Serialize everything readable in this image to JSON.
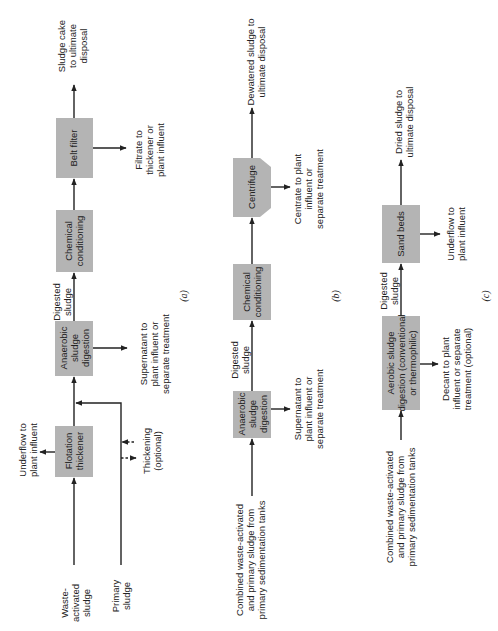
{
  "diagrams": {
    "a": {
      "label": "(a)",
      "boxes": {
        "flotation": [
          "Flotation",
          "thickener"
        ],
        "anaerobic": [
          "Anaerobic",
          "sludge",
          "digestion"
        ],
        "chemical": [
          "Chemical",
          "conditioning"
        ],
        "belt": [
          "Belt filter"
        ]
      },
      "texts": {
        "waste": [
          "Waste-",
          "activated",
          "sludge"
        ],
        "primary": [
          "Primary",
          "sludge"
        ],
        "underflow": [
          "Underflow to",
          "plant influent"
        ],
        "thickening": [
          "Thickening",
          "(optional)"
        ],
        "supernatant": [
          "Supernatant to",
          "plant influent or",
          "separate treatment"
        ],
        "digested": [
          "Digested",
          "sludge"
        ],
        "filtrate": [
          "Filtrate to",
          "thickener or",
          "plant influent"
        ],
        "cake": [
          "Sludge cake",
          "to ultimate",
          "disposal"
        ]
      }
    },
    "b": {
      "label": "(b)",
      "boxes": {
        "anaerobic": [
          "Anaerobic",
          "sludge",
          "digestion"
        ],
        "chemical": [
          "Chemical",
          "conditioning"
        ],
        "centrifuge": [
          "Centrifuge"
        ]
      },
      "texts": {
        "combined": [
          "Combined waste-activated",
          "and primary sludge from",
          "primary sedimentation tanks"
        ],
        "supernatant": [
          "Supernatant to",
          "plant influent or",
          "separate treatment"
        ],
        "digested": [
          "Digested",
          "sludge"
        ],
        "centrate": [
          "Centrate to plant",
          "influent or",
          "separate treatment"
        ],
        "dewatered": [
          "Dewatered sludge to",
          "ultimate disposal"
        ]
      }
    },
    "c": {
      "label": "(c)",
      "boxes": {
        "aerobic": [
          "Aerobic sludge",
          "digestion (conventional",
          "or thermophilic)"
        ],
        "sand": [
          "Sand beds"
        ]
      },
      "texts": {
        "combined": [
          "Combined waste-activated",
          "and primary sludge from",
          "primary sedimentation tanks"
        ],
        "decant": [
          "Decant to plant",
          "influent or separate",
          "treatment (optional)"
        ],
        "digested": [
          "Digested",
          "sludge"
        ],
        "underflow": [
          "Underflow to",
          "plant influent"
        ],
        "dried": [
          "Dried sludge to",
          "ultimate disposal"
        ]
      }
    }
  }
}
